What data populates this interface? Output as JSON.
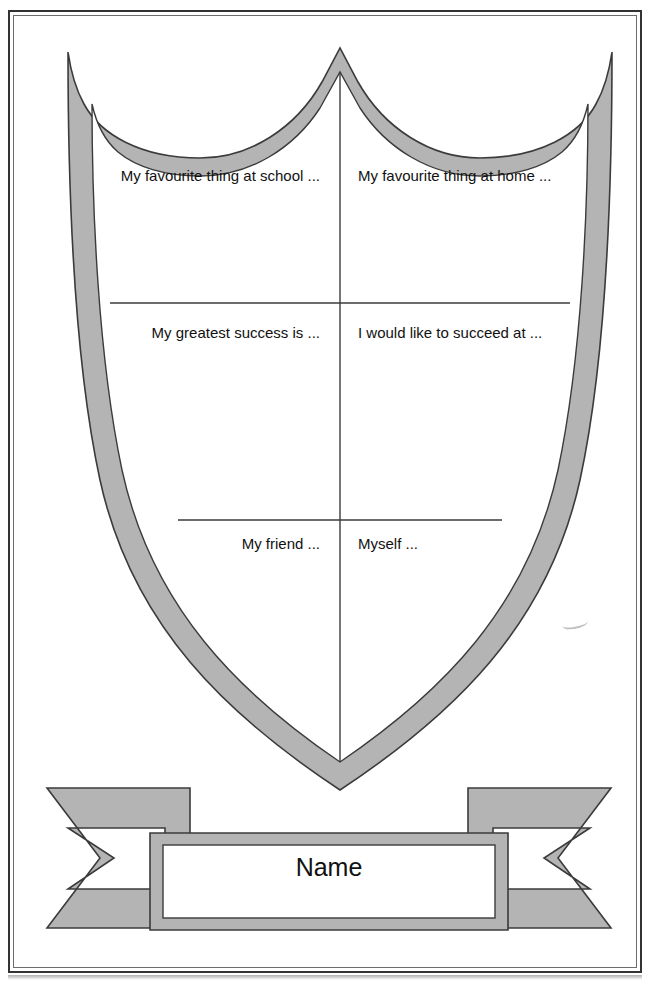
{
  "page": {
    "width": 658,
    "height": 996,
    "background_color": "#ffffff"
  },
  "colors": {
    "shield_fill": "#b4b4b4",
    "shield_stroke": "#3b3b3b",
    "panel_fill": "#ffffff",
    "divider": "#3b3b3b",
    "text": "#111111",
    "page_border": "#333333"
  },
  "shield": {
    "name": "shield-outline",
    "description": "Heraldic shield with scalloped top, grey border band and white interior",
    "segments": [
      {
        "id": "top-left",
        "data_name": "shield-segment-top-left",
        "prompt": "My favourite thing at school ...",
        "row": 1,
        "column": "left"
      },
      {
        "id": "top-right",
        "data_name": "shield-segment-top-right",
        "prompt": "My favourite thing at home ...",
        "row": 1,
        "column": "right"
      },
      {
        "id": "middle-left",
        "data_name": "shield-segment-middle-left",
        "prompt": "My greatest success is ...",
        "row": 2,
        "column": "left"
      },
      {
        "id": "middle-right",
        "data_name": "shield-segment-middle-right",
        "prompt": "I would like to succeed at ...",
        "row": 2,
        "column": "right"
      },
      {
        "id": "bottom-left",
        "data_name": "shield-segment-bottom-left",
        "prompt": "My friend ...",
        "row": 3,
        "column": "left"
      },
      {
        "id": "bottom-right",
        "data_name": "shield-segment-bottom-right",
        "prompt": "Myself ...",
        "row": 3,
        "column": "right"
      }
    ]
  },
  "banner": {
    "name": "name-banner",
    "label": "Name",
    "description": "Ribbon scroll with swallowtail ends below the shield"
  }
}
